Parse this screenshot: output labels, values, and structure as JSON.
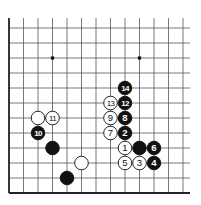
{
  "diagram": {
    "type": "go-board-fragment",
    "grid": {
      "origin_x": 9,
      "origin_y": 28,
      "spacing_x": 14.5,
      "spacing_y": 15,
      "cols": 13,
      "rows": 12,
      "top_extent_y": 18,
      "right_extent_x": 190,
      "line_color": "#555555",
      "edge_color": "#222222"
    },
    "star_points": [
      {
        "col": 3,
        "row": 2
      },
      {
        "col": 9,
        "row": 2
      }
    ],
    "stones": [
      {
        "color": "black",
        "col": 8,
        "row": 4,
        "label": "14"
      },
      {
        "color": "white",
        "col": 7,
        "row": 5,
        "label": "13"
      },
      {
        "color": "black",
        "col": 8,
        "row": 5,
        "label": "12"
      },
      {
        "color": "white",
        "col": 2,
        "row": 6,
        "label": ""
      },
      {
        "color": "white",
        "col": 3,
        "row": 6,
        "label": "11"
      },
      {
        "color": "white",
        "col": 7,
        "row": 6,
        "label": "9"
      },
      {
        "color": "black",
        "col": 8,
        "row": 6,
        "label": "8"
      },
      {
        "color": "black",
        "col": 2,
        "row": 7,
        "label": "10"
      },
      {
        "color": "white",
        "col": 7,
        "row": 7,
        "label": "7"
      },
      {
        "color": "black",
        "col": 8,
        "row": 7,
        "label": "2"
      },
      {
        "color": "black",
        "col": 3,
        "row": 8,
        "label": ""
      },
      {
        "color": "white",
        "col": 8,
        "row": 8,
        "label": "1"
      },
      {
        "color": "black",
        "col": 9,
        "row": 8,
        "label": ""
      },
      {
        "color": "black",
        "col": 10,
        "row": 8,
        "label": "6"
      },
      {
        "color": "white",
        "col": 5,
        "row": 9,
        "label": ""
      },
      {
        "color": "white",
        "col": 8,
        "row": 9,
        "label": "5"
      },
      {
        "color": "white",
        "col": 9,
        "row": 9,
        "label": "3"
      },
      {
        "color": "black",
        "col": 10,
        "row": 9,
        "label": "4"
      },
      {
        "color": "black",
        "col": 4,
        "row": 10,
        "label": ""
      }
    ]
  }
}
